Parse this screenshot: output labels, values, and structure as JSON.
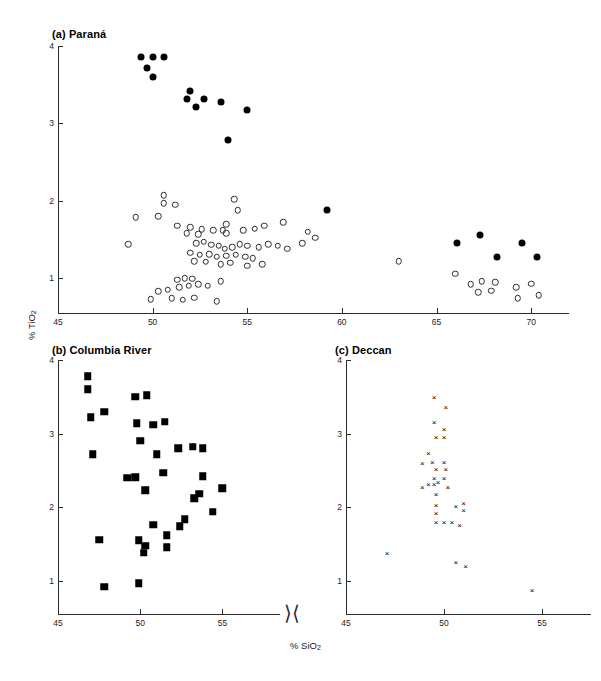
{
  "figure": {
    "axis_label_y": "% TiO2",
    "axis_label_x": "% SiO2",
    "axis_break_symbol": "⟩⟨"
  },
  "panels": [
    {
      "id": "parana",
      "title": "(a) Paraná",
      "xticks": [
        "45",
        "50",
        "55",
        "60",
        "65",
        "70"
      ],
      "yticks": [
        "1",
        "2",
        "3",
        "4"
      ]
    },
    {
      "id": "columbia-river",
      "title": "(b) Columbia River",
      "xticks": [
        "45",
        "50",
        "55"
      ],
      "yticks": [
        "1",
        "2",
        "3",
        "4"
      ]
    },
    {
      "id": "deccan",
      "title": "(c) Deccan",
      "xticks": [
        "45",
        "50",
        "55"
      ],
      "yticks": [
        "1",
        "2",
        "3",
        "4"
      ]
    }
  ],
  "chart_data": [
    {
      "type": "scatter",
      "panel": "(a) Paraná",
      "title": "(a) Paraná",
      "xlabel": "% SiO2",
      "ylabel": "% TiO2",
      "xlim": [
        45,
        72
      ],
      "ylim": [
        0.55,
        4
      ],
      "grid": false,
      "legend": "none",
      "series": [
        {
          "name": "high-TiO2 basalts",
          "marker": "filled-circle",
          "color": "#000000",
          "points": [
            [
              49.4,
              3.86
            ],
            [
              50.0,
              3.86
            ],
            [
              50.6,
              3.86
            ],
            [
              49.7,
              3.72
            ],
            [
              50.0,
              3.6
            ],
            [
              52.0,
              3.42
            ],
            [
              51.8,
              3.31
            ],
            [
              52.7,
              3.32
            ],
            [
              52.3,
              3.21
            ],
            [
              53.6,
              3.28
            ],
            [
              55.0,
              3.17
            ],
            [
              54.0,
              2.79
            ],
            [
              59.2,
              1.88
            ],
            [
              66.1,
              1.46
            ],
            [
              67.3,
              1.56
            ],
            [
              69.5,
              1.45
            ],
            [
              68.2,
              1.27
            ],
            [
              70.3,
              1.28
            ]
          ]
        },
        {
          "name": "low-TiO2 basalts and rhyolites",
          "marker": "open-circle",
          "color": "#2d2d2d",
          "points": [
            [
              50.6,
              2.07
            ],
            [
              50.6,
              1.97
            ],
            [
              51.2,
              1.95
            ],
            [
              49.1,
              1.79
            ],
            [
              50.3,
              1.8
            ],
            [
              54.3,
              2.02
            ],
            [
              54.5,
              1.88
            ],
            [
              51.3,
              1.68
            ],
            [
              52.0,
              1.66
            ],
            [
              52.6,
              1.63
            ],
            [
              53.2,
              1.62
            ],
            [
              53.7,
              1.62
            ],
            [
              53.9,
              1.7
            ],
            [
              54.8,
              1.62
            ],
            [
              55.4,
              1.64
            ],
            [
              55.9,
              1.68
            ],
            [
              56.9,
              1.72
            ],
            [
              51.8,
              1.58
            ],
            [
              52.4,
              1.57
            ],
            [
              53.9,
              1.58
            ],
            [
              48.7,
              1.44
            ],
            [
              58.2,
              1.6
            ],
            [
              58.6,
              1.52
            ],
            [
              57.9,
              1.45
            ],
            [
              52.3,
              1.45
            ],
            [
              52.7,
              1.47
            ],
            [
              53.1,
              1.43
            ],
            [
              53.5,
              1.42
            ],
            [
              53.8,
              1.38
            ],
            [
              54.2,
              1.4
            ],
            [
              54.6,
              1.44
            ],
            [
              55.0,
              1.42
            ],
            [
              55.6,
              1.4
            ],
            [
              56.1,
              1.44
            ],
            [
              56.6,
              1.42
            ],
            [
              57.1,
              1.38
            ],
            [
              52.0,
              1.33
            ],
            [
              52.5,
              1.3
            ],
            [
              53.0,
              1.31
            ],
            [
              53.4,
              1.28
            ],
            [
              53.9,
              1.29
            ],
            [
              54.4,
              1.3
            ],
            [
              54.9,
              1.28
            ],
            [
              55.3,
              1.26
            ],
            [
              52.2,
              1.22
            ],
            [
              52.8,
              1.21
            ],
            [
              53.6,
              1.18
            ],
            [
              54.1,
              1.2
            ],
            [
              55.0,
              1.16
            ],
            [
              55.8,
              1.18
            ],
            [
              51.3,
              0.98
            ],
            [
              51.7,
              1.0
            ],
            [
              52.1,
              0.99
            ],
            [
              51.4,
              0.88
            ],
            [
              51.9,
              0.9
            ],
            [
              52.4,
              0.92
            ],
            [
              52.9,
              0.9
            ],
            [
              53.6,
              0.96
            ],
            [
              50.3,
              0.83
            ],
            [
              50.8,
              0.85
            ],
            [
              49.9,
              0.73
            ],
            [
              51.0,
              0.74
            ],
            [
              51.6,
              0.72
            ],
            [
              52.2,
              0.75
            ],
            [
              53.4,
              0.7
            ],
            [
              63.0,
              1.22
            ],
            [
              66.0,
              1.06
            ],
            [
              66.8,
              0.92
            ],
            [
              67.4,
              0.96
            ],
            [
              67.2,
              0.82
            ],
            [
              67.9,
              0.84
            ],
            [
              68.1,
              0.95
            ],
            [
              69.2,
              0.88
            ],
            [
              69.3,
              0.74
            ],
            [
              70.0,
              0.93
            ],
            [
              70.4,
              0.78
            ]
          ]
        }
      ]
    },
    {
      "type": "scatter",
      "panel": "(b) Columbia River",
      "title": "(b) Columbia River",
      "xlabel": "% SiO2",
      "ylabel": "% TiO2",
      "xlim": [
        45,
        58.5
      ],
      "ylim": [
        0.55,
        4
      ],
      "grid": false,
      "legend": "none",
      "series": [
        {
          "name": "Columbia River basalts",
          "marker": "filled-square",
          "color": "#000000",
          "points": [
            [
              46.8,
              3.78
            ],
            [
              46.8,
              3.6
            ],
            [
              47.8,
              3.3
            ],
            [
              47.0,
              3.22
            ],
            [
              49.7,
              3.5
            ],
            [
              50.4,
              3.52
            ],
            [
              49.8,
              3.14
            ],
            [
              50.8,
              3.12
            ],
            [
              51.5,
              3.16
            ],
            [
              50.0,
              2.9
            ],
            [
              52.3,
              2.8
            ],
            [
              53.2,
              2.82
            ],
            [
              53.8,
              2.8
            ],
            [
              47.1,
              2.72
            ],
            [
              51.0,
              2.72
            ],
            [
              49.2,
              2.4
            ],
            [
              49.7,
              2.41
            ],
            [
              53.8,
              2.42
            ],
            [
              51.4,
              2.47
            ],
            [
              50.3,
              2.23
            ],
            [
              55.0,
              2.26
            ],
            [
              53.6,
              2.18
            ],
            [
              53.3,
              2.12
            ],
            [
              54.4,
              1.94
            ],
            [
              52.7,
              1.84
            ],
            [
              52.4,
              1.74
            ],
            [
              50.8,
              1.76
            ],
            [
              51.6,
              1.62
            ],
            [
              47.5,
              1.56
            ],
            [
              49.9,
              1.55
            ],
            [
              50.3,
              1.48
            ],
            [
              51.6,
              1.46
            ],
            [
              50.2,
              1.38
            ],
            [
              47.8,
              0.92
            ],
            [
              49.9,
              0.97
            ]
          ]
        }
      ]
    },
    {
      "type": "scatter",
      "panel": "(c) Deccan",
      "title": "(c) Deccan",
      "xlabel": "% SiO2",
      "ylabel": "% TiO2",
      "xlim": [
        45,
        57.5
      ],
      "ylim": [
        0.55,
        4
      ],
      "grid": false,
      "legend": "none",
      "series": [
        {
          "name": "Deccan basalts",
          "marker": "cross",
          "color": "#000000",
          "points": [
            [
              49.5,
              3.5
            ],
            [
              50.1,
              3.36
            ],
            [
              49.5,
              3.16
            ],
            [
              50.0,
              3.06
            ],
            [
              49.6,
              2.95
            ],
            [
              50.0,
              2.95
            ],
            [
              49.2,
              2.74
            ],
            [
              48.9,
              2.6
            ],
            [
              49.4,
              2.62
            ],
            [
              50.0,
              2.62
            ],
            [
              49.6,
              2.52
            ],
            [
              50.1,
              2.52
            ],
            [
              49.5,
              2.4
            ],
            [
              50.0,
              2.4
            ],
            [
              49.2,
              2.32
            ],
            [
              49.5,
              2.32
            ],
            [
              49.7,
              2.34
            ],
            [
              48.9,
              2.28
            ],
            [
              50.2,
              2.28
            ],
            [
              49.6,
              2.18
            ],
            [
              49.6,
              2.03
            ],
            [
              50.6,
              2.02
            ],
            [
              51.0,
              2.06
            ],
            [
              49.6,
              1.92
            ],
            [
              51.0,
              1.96
            ],
            [
              49.6,
              1.8
            ],
            [
              50.0,
              1.8
            ],
            [
              50.4,
              1.8
            ],
            [
              50.8,
              1.76
            ],
            [
              47.1,
              1.38
            ],
            [
              50.6,
              1.26
            ],
            [
              51.1,
              1.2
            ],
            [
              54.5,
              0.88
            ]
          ]
        }
      ]
    }
  ]
}
